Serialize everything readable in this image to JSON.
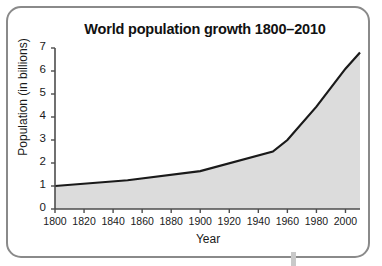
{
  "chart_data": {
    "type": "area",
    "title": "World population growth 1800–2010",
    "xlabel": "Year",
    "ylabel": "Population (in billions)",
    "xlim": [
      1800,
      2010
    ],
    "ylim": [
      0,
      7
    ],
    "grid": false,
    "legend": false,
    "line_color": "#1a1a1a",
    "fill_color": "#d9d9d9",
    "x_ticks": [
      1800,
      1820,
      1840,
      1860,
      1880,
      1900,
      1920,
      1940,
      1960,
      1980,
      2000
    ],
    "y_ticks": [
      0,
      1,
      2,
      3,
      4,
      5,
      6,
      7
    ],
    "x": [
      1800,
      1850,
      1900,
      1950,
      1960,
      1980,
      2000,
      2010
    ],
    "values": [
      1.0,
      1.25,
      1.65,
      2.5,
      3.0,
      4.45,
      6.1,
      6.8
    ],
    "series": [
      {
        "name": "World population",
        "points": [
          {
            "year": 1800,
            "population": 1.0
          },
          {
            "year": 1850,
            "population": 1.25
          },
          {
            "year": 1900,
            "population": 1.65
          },
          {
            "year": 1950,
            "population": 2.5
          },
          {
            "year": 1960,
            "population": 3.0
          },
          {
            "year": 1980,
            "population": 4.45
          },
          {
            "year": 2000,
            "population": 6.1
          },
          {
            "year": 2010,
            "population": 6.8
          }
        ]
      }
    ]
  },
  "figure": {
    "border_color": "#8a8a8a",
    "background": "#ffffff"
  }
}
